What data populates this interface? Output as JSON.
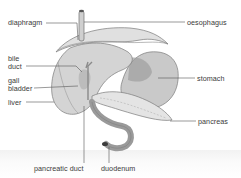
{
  "diagram": {
    "labels": {
      "diaphragm": "diaphragm",
      "oesophagus": "oesophagus",
      "bile_duct_line1": "bile",
      "bile_duct_line2": "duct",
      "gall_bladder_line1": "gall",
      "gall_bladder_line2": "bladder",
      "liver": "liver",
      "stomach": "stomach",
      "pancreas": "pancreas",
      "pancreatic_duct": "pancreatic duct",
      "duodenum": "duodenum"
    },
    "colors": {
      "organ_light": "#dcdcdc",
      "organ_mid": "#bdbdbd",
      "organ_dark": "#8e8e8e",
      "outline": "#6e6e6e",
      "leader_line": "#555555",
      "label_text": "#3a3a3a",
      "background": "#ffffff"
    }
  }
}
